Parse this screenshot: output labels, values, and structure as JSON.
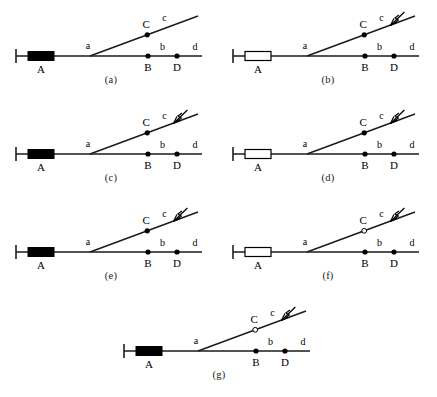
{
  "figure": {
    "colors": {
      "line": "#1a1a1a",
      "fill_node": "#000000",
      "hollow_fill": "#ffffff",
      "stroke": "#000000",
      "caption": "#1a1a1a"
    },
    "common_labels": {
      "source": "A",
      "junction": "a",
      "branch_node": "C",
      "branch_segment": "c",
      "main_node_1": "B",
      "main_segment_1": "b",
      "main_node_2": "D",
      "main_segment_2": "d"
    },
    "panels": [
      {
        "id": "a",
        "caption": "(a)",
        "source_box": "filled",
        "c_node": "filled",
        "fault_marker": "none",
        "labels": {
          "source": "A",
          "junction": "a",
          "branch_node": "C",
          "branch_segment": "c",
          "main_node_1": "B",
          "main_segment_1": "b",
          "main_node_2": "D",
          "main_segment_2": "d"
        }
      },
      {
        "id": "b",
        "caption": "(b)",
        "source_box": "hollow",
        "c_node": "filled",
        "fault_marker": "lightning",
        "labels": {
          "source": "A",
          "junction": "a",
          "branch_node": "C",
          "branch_segment": "c",
          "main_node_1": "B",
          "main_segment_1": "b",
          "main_node_2": "D",
          "main_segment_2": "d"
        }
      },
      {
        "id": "c",
        "caption": "(c)",
        "source_box": "filled",
        "c_node": "filled",
        "fault_marker": "lightning",
        "labels": {
          "source": "A",
          "junction": "a",
          "branch_node": "C",
          "branch_segment": "c",
          "main_node_1": "B",
          "main_segment_1": "b",
          "main_node_2": "D",
          "main_segment_2": "d"
        }
      },
      {
        "id": "d",
        "caption": "(d)",
        "source_box": "hollow",
        "c_node": "filled",
        "fault_marker": "lightning",
        "labels": {
          "source": "A",
          "junction": "a",
          "branch_node": "C",
          "branch_segment": "c",
          "main_node_1": "B",
          "main_segment_1": "b",
          "main_node_2": "D",
          "main_segment_2": "d"
        }
      },
      {
        "id": "e",
        "caption": "(e)",
        "source_box": "filled",
        "c_node": "filled",
        "fault_marker": "lightning",
        "labels": {
          "source": "A",
          "junction": "a",
          "branch_node": "C",
          "branch_segment": "c",
          "main_node_1": "B",
          "main_segment_1": "b",
          "main_node_2": "D",
          "main_segment_2": "d"
        }
      },
      {
        "id": "f",
        "caption": "(f)",
        "source_box": "hollow",
        "c_node": "hollow",
        "fault_marker": "lightning",
        "labels": {
          "source": "A",
          "junction": "a",
          "branch_node": "C",
          "branch_segment": "c",
          "main_node_1": "B",
          "main_segment_1": "b",
          "main_node_2": "D",
          "main_segment_2": "d"
        }
      },
      {
        "id": "g",
        "caption": "(g)",
        "source_box": "filled",
        "c_node": "hollow",
        "fault_marker": "lightning",
        "labels": {
          "source": "A",
          "junction": "a",
          "branch_node": "C",
          "branch_segment": "c",
          "main_node_1": "B",
          "main_segment_1": "b",
          "main_node_2": "D",
          "main_segment_2": "d"
        }
      }
    ]
  }
}
